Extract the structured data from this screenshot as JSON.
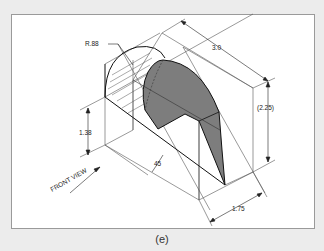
{
  "figure": {
    "caption": "(e)",
    "colors": {
      "page_background": "#ececec",
      "frame_background": "#ffffff",
      "frame_border": "#9a9a9a",
      "line": "#222222",
      "construction_line": "#555555",
      "shaded_face": "#7d7d7d"
    }
  },
  "labels": {
    "radius": "R.88",
    "length": "3.0",
    "height": "(2.25)",
    "base_height": "1.38",
    "angle": "45",
    "depth": "1.75",
    "front_view": "FRONT VIEW"
  }
}
